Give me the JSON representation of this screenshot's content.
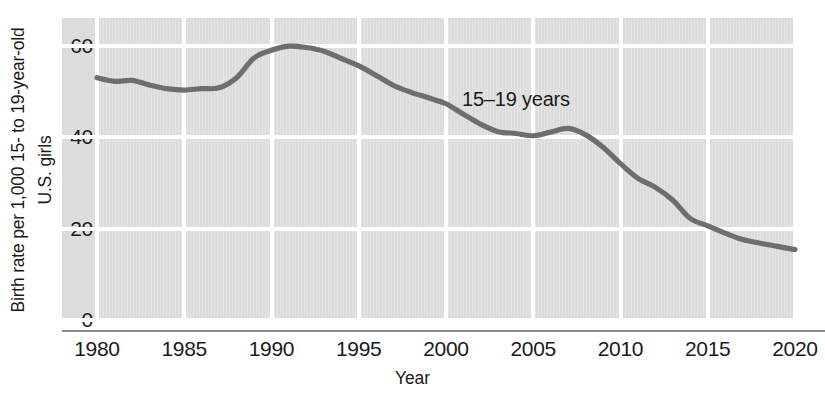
{
  "chart_data": {
    "type": "line",
    "title": "",
    "xlabel": "Year",
    "ylabel_line1": "Birth rate per 1,000 15- to 19-year-old",
    "ylabel_line2": "U.S. girls",
    "annotation": "15–19 years",
    "xlim": [
      1980,
      2020
    ],
    "ylim": [
      0,
      65
    ],
    "grid": true,
    "legend_position": "inline-annotation",
    "x_ticks": [
      1980,
      1985,
      1990,
      1995,
      2000,
      2005,
      2010,
      2015,
      2020
    ],
    "x_tick_labels": [
      "1980",
      "1985",
      "1990",
      "1995",
      "2000",
      "2005",
      "2010",
      "2015",
      "2020"
    ],
    "y_ticks": [
      0,
      20,
      40,
      60
    ],
    "y_tick_labels": [
      "0",
      "20",
      "40",
      "60"
    ],
    "series": [
      {
        "name": "15–19 years",
        "color": "#6e6e6e",
        "x": [
          1980,
          1981,
          1982,
          1983,
          1984,
          1985,
          1986,
          1987,
          1988,
          1989,
          1990,
          1991,
          1992,
          1993,
          1994,
          1995,
          1996,
          1997,
          1998,
          1999,
          2000,
          2001,
          2002,
          2003,
          2004,
          2005,
          2006,
          2007,
          2008,
          2009,
          2010,
          2011,
          2012,
          2013,
          2014,
          2015,
          2016,
          2017,
          2018,
          2019,
          2020
        ],
        "values": [
          53.0,
          52.2,
          52.4,
          51.4,
          50.6,
          50.3,
          50.6,
          50.8,
          53.0,
          57.3,
          59.0,
          59.9,
          59.6,
          58.8,
          57.2,
          55.6,
          53.5,
          51.3,
          49.8,
          48.6,
          47.3,
          45.0,
          42.8,
          41.2,
          40.8,
          40.3,
          41.1,
          41.9,
          40.5,
          37.8,
          34.2,
          31.0,
          29.0,
          26.2,
          22.2,
          20.6,
          19.0,
          17.6,
          16.8,
          16.1,
          15.4
        ]
      }
    ]
  }
}
